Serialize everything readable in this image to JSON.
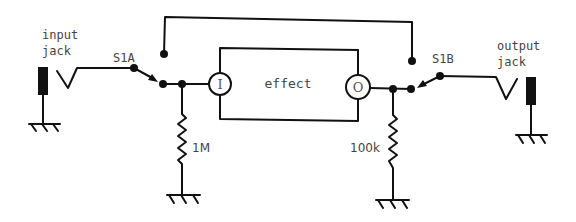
{
  "diagram": {
    "type": "circuit-schematic",
    "labels": {
      "input_jack_line1": "input",
      "input_jack_line2": "jack",
      "output_jack_line1": "output",
      "output_jack_line2": "jack",
      "switch_a": "S1A",
      "switch_b": "S1B",
      "effect_block": "effect",
      "effect_input_port": "I",
      "effect_output_port": "O",
      "resistor_input": "1M",
      "resistor_output": "100k"
    },
    "components": [
      {
        "id": "input-jack",
        "kind": "jack",
        "label": "input jack"
      },
      {
        "id": "S1A",
        "kind": "switch-pole",
        "label": "S1A"
      },
      {
        "id": "R1",
        "kind": "resistor",
        "value": "1M",
        "to": "ground"
      },
      {
        "id": "effect",
        "kind": "block",
        "label": "effect",
        "ports": [
          "I",
          "O"
        ]
      },
      {
        "id": "R2",
        "kind": "resistor",
        "value": "100k",
        "to": "ground"
      },
      {
        "id": "S1B",
        "kind": "switch-pole",
        "label": "S1B"
      },
      {
        "id": "output-jack",
        "kind": "jack",
        "label": "output jack"
      }
    ],
    "connections": [
      [
        "input-jack",
        "S1A.common"
      ],
      [
        "S1A.throw-effect",
        "R1"
      ],
      [
        "S1A.throw-effect",
        "effect.I"
      ],
      [
        "S1A.throw-bypass",
        "S1B.throw-bypass"
      ],
      [
        "effect.O",
        "R2"
      ],
      [
        "effect.O",
        "S1B.throw-effect"
      ],
      [
        "S1B.common",
        "output-jack"
      ]
    ],
    "colors": {
      "line": "#111111",
      "text": "#444444",
      "background": "#ffffff"
    }
  }
}
